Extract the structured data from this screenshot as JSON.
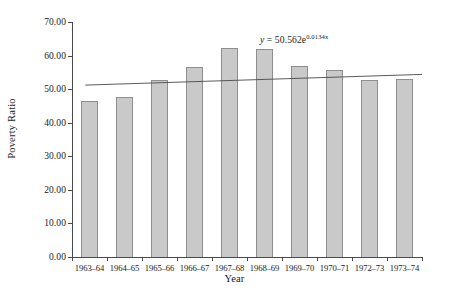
{
  "chart_data": {
    "type": "bar",
    "title": "",
    "xlabel": "Year",
    "ylabel": "Poverty Ratio",
    "categories": [
      "1963–64",
      "1964–65",
      "1965–66",
      "1966–67",
      "1967–68",
      "1968–69",
      "1969–70",
      "1970–71",
      "1972–73",
      "1973–74"
    ],
    "values": [
      46.5,
      47.8,
      52.6,
      56.6,
      62.2,
      61.9,
      56.9,
      55.8,
      52.6,
      53.1
    ],
    "ylim": [
      0,
      70
    ],
    "yticks": [
      0,
      10,
      20,
      30,
      40,
      50,
      60,
      70
    ],
    "ytick_labels": [
      "0.00",
      "10.00",
      "20.00",
      "30.00",
      "40.00",
      "50.00",
      "60.00",
      "70.00"
    ],
    "grid": false,
    "legend": "none",
    "series_name": "Poverty Ratio",
    "bar_fill_color": "#c9c9c9",
    "bar_border_color": "#8e8e8e",
    "axis_color": "#4a4a4a",
    "annotations": [
      {
        "name": "trendline-equation",
        "text_prefix": "y = 50.562e",
        "text_exponent": "0.0134x",
        "full_text": "y = 50.562e^0.0134x"
      }
    ],
    "trendline": {
      "type": "exponential",
      "coefficient": 50.562,
      "rate": 0.0134,
      "start_value": 51.2,
      "end_value": 54.4,
      "color": "#4a4a4a"
    }
  }
}
